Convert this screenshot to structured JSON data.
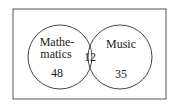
{
  "diagram": {
    "type": "venn",
    "sets": [
      {
        "label_line1": "Mathe-",
        "label_line2": "matics",
        "only_count": "48"
      },
      {
        "label": "Music",
        "only_count": "35"
      }
    ],
    "intersection_count": "12",
    "colors": {
      "stroke": "#444444",
      "text": "#222222",
      "background": "#ffffff"
    }
  }
}
